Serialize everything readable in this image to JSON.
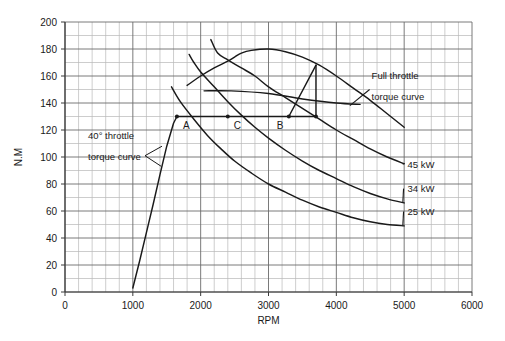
{
  "chart_data": {
    "type": "line",
    "title": "",
    "xlabel": "RPM",
    "ylabel": "N.M",
    "xlim": [
      0,
      6000
    ],
    "ylim": [
      0,
      200
    ],
    "xticks": [
      0,
      1000,
      2000,
      3000,
      4000,
      5000,
      6000
    ],
    "yticks": [
      0,
      20,
      40,
      60,
      80,
      100,
      120,
      140,
      160,
      180,
      200
    ],
    "xtick_labels": [
      "0",
      "1000",
      "2000",
      "3000",
      "4000",
      "5000",
      "6000"
    ],
    "ytick_labels": [
      "0",
      "20",
      "40",
      "60",
      "80",
      "100",
      "120",
      "140",
      "160",
      "180",
      "200"
    ],
    "grid": true,
    "grid_major_x": 1000,
    "grid_minor_x": 200,
    "grid_major_y": 20,
    "grid_minor_y": 10,
    "legend": "none",
    "series": [
      {
        "name": "Full throttle torque curve",
        "points": [
          [
            1800,
            153
          ],
          [
            2000,
            160
          ],
          [
            2200,
            166
          ],
          [
            2400,
            171
          ],
          [
            2500,
            174
          ],
          [
            2600,
            177
          ],
          [
            2750,
            179
          ],
          [
            3000,
            180
          ],
          [
            3250,
            178
          ],
          [
            3500,
            174
          ],
          [
            3750,
            168
          ],
          [
            4000,
            160
          ],
          [
            4250,
            151
          ],
          [
            4500,
            142
          ],
          [
            4750,
            132
          ],
          [
            5000,
            122
          ]
        ]
      },
      {
        "name": "40 degree throttle torque curve",
        "points": [
          [
            1000,
            3
          ],
          [
            1100,
            23
          ],
          [
            1200,
            44
          ],
          [
            1300,
            65
          ],
          [
            1400,
            87
          ],
          [
            1500,
            108
          ],
          [
            1600,
            125
          ],
          [
            1650,
            130
          ]
        ]
      },
      {
        "name": "45 kW constant power curve",
        "points": [
          [
            2150,
            187
          ],
          [
            2250,
            177
          ],
          [
            2400,
            172
          ],
          [
            2600,
            166
          ],
          [
            2800,
            160
          ],
          [
            3000,
            152
          ],
          [
            3250,
            144
          ],
          [
            3500,
            136
          ],
          [
            3750,
            128
          ],
          [
            4000,
            120
          ],
          [
            4250,
            113
          ],
          [
            4500,
            106
          ],
          [
            4750,
            100
          ],
          [
            5000,
            95
          ]
        ]
      },
      {
        "name": "34 kW constant power curve",
        "points": [
          [
            1830,
            176
          ],
          [
            1900,
            170
          ],
          [
            2000,
            163
          ],
          [
            2200,
            152
          ],
          [
            2400,
            141
          ],
          [
            2600,
            131
          ],
          [
            2800,
            122
          ],
          [
            3000,
            114
          ],
          [
            3250,
            105
          ],
          [
            3500,
            97
          ],
          [
            3750,
            90
          ],
          [
            4000,
            84
          ],
          [
            4250,
            78
          ],
          [
            4500,
            73
          ],
          [
            4750,
            69
          ],
          [
            5000,
            66
          ]
        ]
      },
      {
        "name": "25 kW constant power curve",
        "points": [
          [
            1570,
            152
          ],
          [
            1700,
            141
          ],
          [
            1900,
            128
          ],
          [
            2100,
            116
          ],
          [
            2300,
            106
          ],
          [
            2500,
            97
          ],
          [
            2750,
            88
          ],
          [
            3000,
            80
          ],
          [
            3250,
            74
          ],
          [
            3500,
            68
          ],
          [
            3750,
            63
          ],
          [
            4000,
            59
          ],
          [
            4250,
            55
          ],
          [
            4500,
            52
          ],
          [
            4750,
            50
          ],
          [
            5000,
            49
          ]
        ]
      },
      {
        "name": "constant torque line 150 N.M",
        "points": [
          [
            2050,
            149
          ],
          [
            2450,
            149
          ],
          [
            3000,
            147
          ],
          [
            3500,
            143
          ],
          [
            4000,
            140
          ],
          [
            4350,
            139
          ]
        ]
      },
      {
        "name": "constant torque line 130 N.M",
        "points": [
          [
            1650,
            130
          ],
          [
            3700,
            130
          ]
        ]
      },
      {
        "name": "operating line B to full throttle",
        "points": [
          [
            3300,
            130
          ],
          [
            3700,
            168
          ]
        ]
      },
      {
        "name": "vertical drop at 3700",
        "points": [
          [
            3700,
            168
          ],
          [
            3700,
            130
          ]
        ]
      }
    ],
    "markers": [
      {
        "label": "A",
        "x": 1650,
        "y": 130
      },
      {
        "label": "C",
        "x": 2400,
        "y": 130
      },
      {
        "label": "B",
        "x": 3300,
        "y": 130
      },
      {
        "label": "",
        "x": 3700,
        "y": 130
      }
    ],
    "annotations": [
      {
        "name": "full-throttle-annotation",
        "line1": "Full throttle",
        "line2": "torque curve",
        "x": 4550,
        "y": 150
      },
      {
        "name": "forty-throttle-annotation",
        "line1": "40° throttle",
        "line2": "torque curve",
        "x": 1100,
        "y": 105
      },
      {
        "name": "power-label-45",
        "text": "45 kW",
        "x": 5000,
        "y": 92
      },
      {
        "name": "power-label-34",
        "text": "34 kW",
        "x": 5000,
        "y": 74
      },
      {
        "name": "power-label-25",
        "text": "25 kW",
        "x": 5000,
        "y": 57
      }
    ]
  },
  "axes": {
    "x_title": "RPM",
    "y_title": "N.M"
  },
  "point_labels": {
    "a": "A",
    "c": "C",
    "b": "B"
  },
  "power_labels": {
    "p45": "45 kW",
    "p34": "34 kW",
    "p25": "25 kW"
  },
  "annotations": {
    "full_throttle_line1": "Full throttle",
    "full_throttle_line2": "torque curve",
    "forty_throttle_line1": "40° throttle",
    "forty_throttle_line2": "torque curve"
  },
  "xtick_labels": {
    "t0": "0",
    "t1": "1000",
    "t2": "2000",
    "t3": "3000",
    "t4": "4000",
    "t5": "5000",
    "t6": "6000"
  },
  "ytick_labels": {
    "t0": "0",
    "t20": "20",
    "t40": "40",
    "t60": "60",
    "t80": "80",
    "t100": "100",
    "t120": "120",
    "t140": "140",
    "t160": "160",
    "t180": "180",
    "t200": "200"
  },
  "colors": {
    "curve": "#1a1a1a",
    "grid_major": "#6b6b6b",
    "grid_minor": "#b8b8b8",
    "axis": "#4a4a4a",
    "background": "#ffffff"
  }
}
